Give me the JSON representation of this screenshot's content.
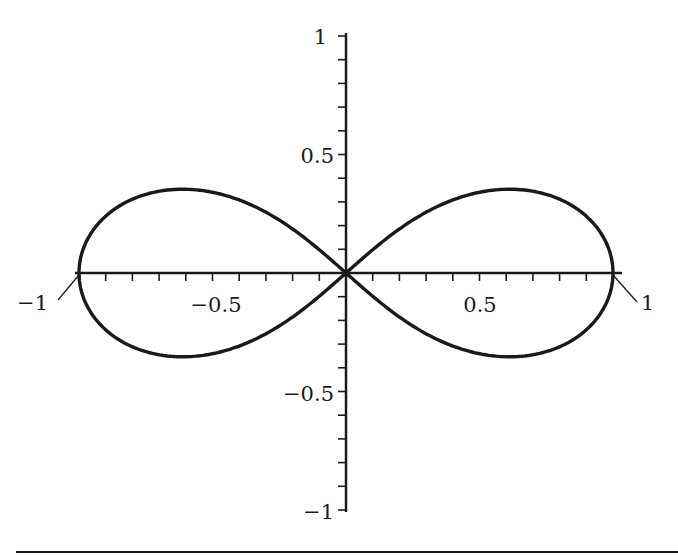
{
  "chart_data": {
    "type": "line",
    "title": "",
    "subtitle": "",
    "xlabel": "",
    "ylabel": "",
    "xlim": [
      -1,
      1
    ],
    "ylim": [
      -1,
      1
    ],
    "grid": false,
    "legend": null,
    "x_ticks": {
      "major": [
        -1,
        -0.5,
        0.5,
        1
      ],
      "minor_step": 0.1
    },
    "y_ticks": {
      "major": [
        -1,
        -0.5,
        0.5,
        1
      ],
      "minor_step": 0.1
    },
    "x_tick_labels": [
      "−1",
      "−0.5",
      "0.5",
      "1"
    ],
    "y_tick_labels": [
      "1",
      "0.5",
      "−0.5",
      "−1"
    ],
    "series": [
      {
        "name": "lemniscate",
        "equation": "(x^2 + y^2)^2 = x^2 - y^2",
        "parametric": "x = cos t / (1 + sin^2 t), y = sin t cos t / (1 + sin^2 t)",
        "key_points": [
          {
            "x": -1,
            "y": 0
          },
          {
            "x": -0.61,
            "y": 0.35
          },
          {
            "x": 0,
            "y": 0
          },
          {
            "x": 0.61,
            "y": 0.35
          },
          {
            "x": 1,
            "y": 0
          },
          {
            "x": 0.61,
            "y": -0.35
          },
          {
            "x": -0.61,
            "y": -0.35
          }
        ]
      }
    ],
    "annotations": [
      {
        "text": "−1",
        "points_to": {
          "x": -1,
          "y": 0
        }
      },
      {
        "text": "1",
        "points_to": {
          "x": 1,
          "y": 0
        }
      }
    ]
  },
  "labels": {
    "y_top": "1",
    "y_half": "0.5",
    "y_neg_half": "−0.5",
    "y_bottom": "−1",
    "x_neg_half": "−0.5",
    "x_half": "0.5",
    "x_left_callout": "−1",
    "x_right_callout": "1"
  },
  "colors": {
    "curve": "#1a1a1a",
    "axes": "#1a1a1a",
    "background": "#ffffff"
  }
}
